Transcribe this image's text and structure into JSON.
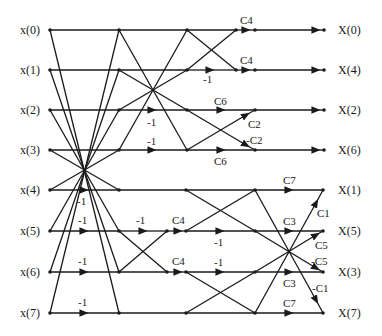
{
  "diagram": {
    "type": "8-point fast DCT signal flow graph (butterfly)",
    "inputs": [
      "x(0)",
      "x(1)",
      "x(2)",
      "x(3)",
      "x(4)",
      "x(5)",
      "x(6)",
      "x(7)"
    ],
    "outputs": [
      "X(0)",
      "X(4)",
      "X(2)",
      "X(6)",
      "X(1)",
      "X(5)",
      "X(3)",
      "X(7)"
    ],
    "weights": {
      "stage1": [
        "-1",
        "-1",
        "-1",
        "-1"
      ],
      "stage2_upper": [
        "-1",
        "-1"
      ],
      "stage2_lower": [
        "-1",
        "-1",
        "C4",
        "C4"
      ],
      "stage3_upper": [
        "C4",
        "-1",
        "C4",
        "C6",
        "C2",
        "-C2",
        "C6"
      ],
      "stage3_lower": [
        "-1",
        "-1"
      ],
      "stage4": [
        "C7",
        "C1",
        "C3",
        "C5",
        "-C5",
        "C3",
        "-C1",
        "C7"
      ]
    },
    "colors": {
      "line": "#1a1a1a",
      "background": "#ffffff"
    }
  }
}
